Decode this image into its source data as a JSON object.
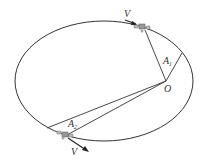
{
  "diagram": {
    "labels": {
      "focus": "O",
      "area1": "A",
      "area1_sub": "1",
      "area2": "A",
      "area2_sub": "2",
      "velocity_top": "V",
      "velocity_bottom": "V"
    },
    "colors": {
      "line": "#333333",
      "background": "#ffffff",
      "satellite": "#888888"
    }
  }
}
